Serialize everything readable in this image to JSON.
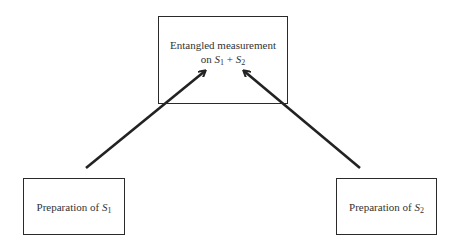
{
  "diagram": {
    "top_box": {
      "line1": "Entangled measurement",
      "line2_prefix": "on ",
      "var1": "S",
      "sub1": "1",
      "plus": " + ",
      "var2": "S",
      "sub2": "2"
    },
    "left_box": {
      "prefix": "Preparation of ",
      "var": "S",
      "sub": "1"
    },
    "right_box": {
      "prefix": "Preparation of ",
      "var": "S",
      "sub": "2"
    },
    "arrows": [
      {
        "from": "left_box",
        "to": "top_box"
      },
      {
        "from": "right_box",
        "to": "top_box"
      }
    ]
  }
}
